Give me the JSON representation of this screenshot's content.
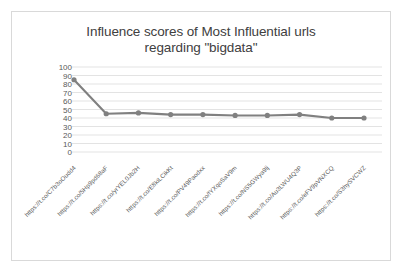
{
  "chart_data": {
    "type": "line",
    "title": "Influence scores of Most Influential urls regarding \"bigdata\"",
    "title_lines": [
      "Influence scores of Most Influential urls",
      "regarding \"bigdata\""
    ],
    "xlabel": "",
    "ylabel": "",
    "ylim": [
      0,
      100
    ],
    "ytick_step": 10,
    "yticks": [
      100,
      90,
      80,
      70,
      60,
      50,
      40,
      30,
      20,
      10,
      0
    ],
    "grid": true,
    "grid_axis": "y",
    "legend": false,
    "legend_position": "none",
    "xtick_rotation": -45,
    "series_color": "#808080",
    "marker": "circle",
    "categories": [
      "https://t.co/C7b3oOudd4",
      "https://t.co/5Hp9pd68aF",
      "https://t.co/yrYEL0Jb2H",
      "https://t.co/E8kiLCikKt",
      "https://t.co/PV49Paodxx",
      "https://t.co/fYXqoSaV9m",
      "https://t.co/NS5GWya9lj",
      "https://t.co/Au3LWU4Q3P",
      "https://t.co/eFV9pVNXCQ",
      "https://t.co/S3hySVCWZ"
    ],
    "values": [
      85,
      45,
      46,
      44,
      44,
      43,
      43,
      44,
      40,
      40
    ]
  },
  "colors": {
    "series": "#808080",
    "grid": "#e3e3e3",
    "frame": "#d9d9d9",
    "text": "#595959",
    "title": "#404040"
  }
}
